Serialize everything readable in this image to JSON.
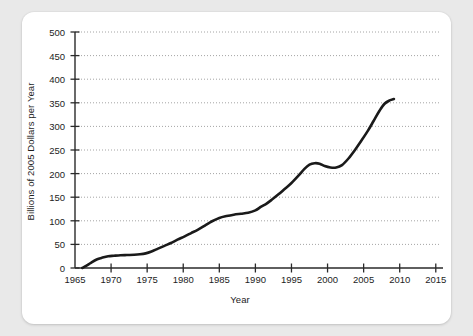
{
  "chart_data": {
    "type": "line",
    "title": "",
    "xlabel": "Year",
    "ylabel": "Billions of 2005 Dollars per Year",
    "xlim": [
      1965,
      2016
    ],
    "ylim": [
      0,
      500
    ],
    "xticks": [
      1965,
      1970,
      1975,
      1980,
      1985,
      1990,
      1995,
      2000,
      2005,
      2010,
      2015
    ],
    "yticks": [
      0,
      50,
      100,
      150,
      200,
      250,
      300,
      350,
      400,
      450,
      500
    ],
    "xtick_labels": [
      "1965",
      "1970",
      "1975",
      "1980",
      "1985",
      "1990",
      "1995",
      "2000",
      "2005",
      "2010",
      "2015"
    ],
    "ytick_labels": [
      "0",
      "50",
      "100",
      "150",
      "200",
      "250",
      "300",
      "350",
      "400",
      "450",
      "500"
    ],
    "grid": "horizontal-dotted",
    "legend": "none",
    "line_color": "#1a1a1a",
    "line_width": 2.6,
    "series": [
      {
        "name": "Spending",
        "x": [
          1966.0,
          1966.6,
          1967.2,
          1968.0,
          1968.8,
          1969.6,
          1970.4,
          1971.3,
          1972.2,
          1973.2,
          1974.0,
          1974.8,
          1975.6,
          1976.5,
          1977.4,
          1978.3,
          1979.2,
          1980.2,
          1981.1,
          1982.0,
          1983.0,
          1984.0,
          1985.0,
          1986.0,
          1987.0,
          1988.0,
          1989.0,
          1990.0,
          1990.8,
          1991.5,
          1992.3,
          1993.2,
          1994.1,
          1995.0,
          1996.0,
          1996.8,
          1997.5,
          1998.2,
          1998.9,
          1999.6,
          2000.4,
          2001.2,
          2002.0,
          2002.9,
          2003.8,
          2004.7,
          2005.6,
          2006.4,
          2007.2,
          2007.9,
          2008.6,
          2009.2
        ],
        "y": [
          0,
          5,
          11,
          18,
          22,
          25,
          26,
          27,
          27.5,
          28,
          29,
          31,
          35,
          41,
          47,
          53,
          60,
          67,
          74,
          81,
          90,
          99,
          106,
          110,
          113,
          115,
          117,
          122,
          130,
          136,
          145,
          156,
          168,
          180,
          196,
          210,
          219,
          222,
          221,
          216,
          213,
          213,
          218,
          232,
          250,
          270,
          291,
          312,
          333,
          348,
          355,
          358
        ]
      }
    ]
  }
}
